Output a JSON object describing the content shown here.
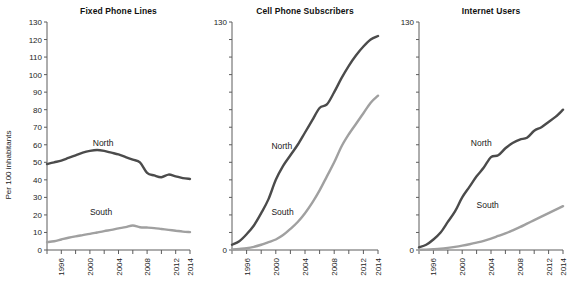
{
  "figure": {
    "ylabel": "Per 100 inhabitants",
    "series_colors": {
      "north": "#4b4b4b",
      "south": "#a0a0a0"
    },
    "axis_color": "#5c5c5c"
  },
  "chart_data": [
    {
      "type": "line",
      "title": "Fixed Phone Lines",
      "xlabel": "",
      "ylabel": "Per 100 inhabitants",
      "xlim": [
        1994,
        2014
      ],
      "ylim": [
        0,
        130
      ],
      "yticks": [
        0,
        10,
        20,
        30,
        40,
        50,
        60,
        70,
        80,
        90,
        100,
        110,
        120,
        130
      ],
      "ytick_labels": [
        "0",
        "10",
        "20",
        "30",
        "40",
        "50",
        "60",
        "70",
        "80",
        "90",
        "100",
        "110",
        "120",
        "130"
      ],
      "xticks": [
        1994,
        1996,
        1998,
        2000,
        2002,
        2004,
        2006,
        2008,
        2010,
        2012,
        2014
      ],
      "xtick_labels": [
        "",
        "1996",
        "",
        "2000",
        "",
        "2004",
        "",
        "2008",
        "",
        "2012",
        "2014"
      ],
      "grid": false,
      "legend_position": "inline-annotation",
      "x": [
        1994,
        1995,
        1996,
        1997,
        1998,
        1999,
        2000,
        2001,
        2002,
        2003,
        2004,
        2005,
        2006,
        2007,
        2008,
        2009,
        2010,
        2011,
        2012,
        2013,
        2014
      ],
      "series": [
        {
          "name": "North",
          "values": [
            49,
            50,
            51,
            52.5,
            54,
            55.5,
            56.5,
            57,
            56.5,
            55.5,
            54.5,
            53,
            51.5,
            50,
            44,
            42.5,
            41.5,
            43,
            42,
            41,
            40.5
          ]
        },
        {
          "name": "South",
          "values": [
            4.5,
            5,
            6,
            7,
            7.8,
            8.5,
            9.2,
            10,
            10.8,
            11.5,
            12.3,
            13,
            14,
            13,
            12.8,
            12.5,
            12,
            11.5,
            11,
            10.5,
            10.2
          ]
        }
      ]
    },
    {
      "type": "line",
      "title": "Cell Phone Subscribers",
      "xlabel": "",
      "ylabel": "",
      "xlim": [
        1994,
        2014
      ],
      "ylim": [
        0,
        130
      ],
      "yticks": [
        0,
        10,
        20,
        30,
        40,
        50,
        60,
        70,
        80,
        90,
        100,
        110,
        120,
        130
      ],
      "ytick_labels": [
        "0",
        "",
        "",
        "",
        "",
        "",
        "",
        "",
        "",
        "",
        "",
        "",
        "",
        "130"
      ],
      "xticks": [
        1994,
        1996,
        1998,
        2000,
        2002,
        2004,
        2006,
        2008,
        2010,
        2012,
        2014
      ],
      "xtick_labels": [
        "",
        "1996",
        "",
        "2000",
        "",
        "2004",
        "",
        "2008",
        "",
        "2012",
        "2014"
      ],
      "grid": false,
      "legend_position": "inline-annotation",
      "x": [
        1994,
        1995,
        1996,
        1997,
        1998,
        1999,
        2000,
        2001,
        2002,
        2003,
        2004,
        2005,
        2006,
        2007,
        2008,
        2009,
        2010,
        2011,
        2012,
        2013,
        2014
      ],
      "series": [
        {
          "name": "North",
          "values": [
            3,
            5,
            9,
            14,
            21,
            29,
            40,
            48,
            54,
            60,
            67,
            74,
            81,
            83,
            90,
            98,
            105,
            111,
            116,
            120,
            122
          ]
        },
        {
          "name": "South",
          "values": [
            0.3,
            0.6,
            1,
            1.8,
            3,
            4.5,
            6,
            8.5,
            12,
            16,
            21,
            27,
            34,
            42,
            50,
            59,
            66,
            72,
            78,
            84,
            88
          ]
        }
      ]
    },
    {
      "type": "line",
      "title": "Internet Users",
      "xlabel": "",
      "ylabel": "",
      "xlim": [
        1994,
        2014
      ],
      "ylim": [
        0,
        130
      ],
      "yticks": [
        0,
        10,
        20,
        30,
        40,
        50,
        60,
        70,
        80,
        90,
        100,
        110,
        120,
        130
      ],
      "ytick_labels": [
        "0",
        "",
        "",
        "",
        "",
        "",
        "",
        "",
        "",
        "",
        "",
        "",
        "",
        "130"
      ],
      "xticks": [
        1994,
        1996,
        1998,
        2000,
        2002,
        2004,
        2006,
        2008,
        2010,
        2012,
        2014
      ],
      "xtick_labels": [
        "",
        "1996",
        "",
        "2000",
        "",
        "2004",
        "",
        "2008",
        "",
        "2012",
        "2014"
      ],
      "grid": false,
      "legend_position": "inline-annotation",
      "x": [
        1994,
        1995,
        1996,
        1997,
        1998,
        1999,
        2000,
        2001,
        2002,
        2003,
        2004,
        2005,
        2006,
        2007,
        2008,
        2009,
        2010,
        2011,
        2012,
        2013,
        2014
      ],
      "series": [
        {
          "name": "North",
          "values": [
            1.5,
            3,
            6,
            10,
            16,
            22,
            30,
            36,
            42,
            47,
            53,
            54,
            58,
            61,
            63,
            64,
            68,
            70,
            73,
            76,
            80
          ]
        },
        {
          "name": "South",
          "values": [
            0.1,
            0.2,
            0.4,
            0.7,
            1.2,
            1.8,
            2.5,
            3.3,
            4.2,
            5.2,
            6.5,
            8,
            9.5,
            11.2,
            13,
            15,
            17,
            19,
            21,
            23,
            25
          ]
        }
      ]
    }
  ]
}
